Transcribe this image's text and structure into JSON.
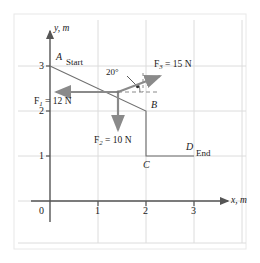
{
  "figure": {
    "colors": {
      "grid": "#d8d8d8",
      "frame": "#e2e2e2",
      "axis": "#555555",
      "path": "#6b6b6b",
      "force": "#8a8a8a",
      "dashed": "#8a8a8a",
      "text": "#1a1a1a"
    }
  },
  "axes": {
    "x": {
      "name": "x, m",
      "ticks": [
        "1",
        "2",
        "3"
      ],
      "origin_label": "0",
      "range": [
        0,
        3.45
      ]
    },
    "y": {
      "name": "y, m",
      "ticks": [
        "1",
        "2",
        "3"
      ],
      "range": [
        0,
        3.45
      ]
    }
  },
  "points": [
    {
      "id": "A",
      "label": "A",
      "note": "Start",
      "x": 0,
      "y": 3
    },
    {
      "id": "B",
      "label": "B",
      "note": "",
      "x": 2,
      "y": 2
    },
    {
      "id": "C",
      "label": "C",
      "note": "",
      "x": 2,
      "y": 1
    },
    {
      "id": "D",
      "label": "D",
      "note": "End",
      "x": 3,
      "y": 1
    }
  ],
  "path": {
    "description": "A to B to C to D",
    "vertices": [
      [
        0,
        3
      ],
      [
        2,
        2
      ],
      [
        2,
        1
      ],
      [
        3,
        1
      ]
    ]
  },
  "forces": [
    {
      "id": "F1",
      "symbol": "F",
      "subscript": "1",
      "equals": " = 12 N",
      "magnitude": 12,
      "unit": "N",
      "direction_deg": 180,
      "label": "F1 = 12 N"
    },
    {
      "id": "F2",
      "symbol": "F",
      "subscript": "2",
      "equals": " = 10 N",
      "magnitude": 10,
      "unit": "N",
      "direction_deg": 270,
      "label": "F2 = 10 N"
    },
    {
      "id": "F3",
      "symbol": "F",
      "subscript": "3",
      "equals": " = 15 N",
      "magnitude": 15,
      "unit": "N",
      "direction_deg": 20,
      "label": "F3 = 15 N"
    }
  ],
  "angle_marker": {
    "label": "20°",
    "value": 20,
    "unit": "degrees",
    "between": [
      "F3",
      "horizontal-dashed-reference"
    ]
  }
}
